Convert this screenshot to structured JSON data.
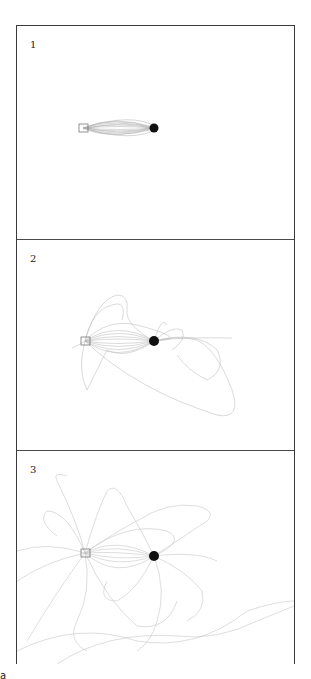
{
  "figure": {
    "panels": [
      {
        "label": "1",
        "spread": "low"
      },
      {
        "label": "2",
        "spread": "medium"
      },
      {
        "label": "3",
        "spread": "high"
      }
    ],
    "corner_label": "a",
    "colors": {
      "trace": "#6f6f6f",
      "target": "#111111",
      "border": "#3a3a3a"
    }
  }
}
